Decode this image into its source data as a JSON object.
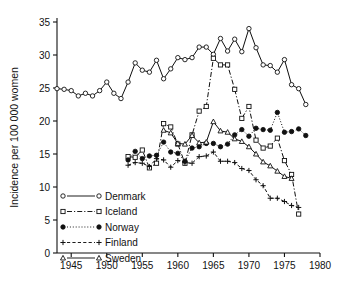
{
  "chart_data": {
    "type": "line",
    "title": "",
    "subtitle": "",
    "xlabel": "",
    "ylabel": "Incidence per 100 000 women",
    "xlim": [
      1943,
      1980
    ],
    "ylim": [
      0,
      35
    ],
    "xticks": [
      1945,
      1950,
      1955,
      1960,
      1965,
      1970,
      1975,
      1980
    ],
    "yticks": [
      0,
      5,
      10,
      15,
      20,
      25,
      30,
      35
    ],
    "xtick_labels": [
      "1945",
      "1950",
      "1955",
      "1960",
      "1965",
      "1970",
      "1975",
      "1980"
    ],
    "ytick_labels": [
      "0",
      "5",
      "10",
      "15",
      "20",
      "25",
      "30",
      "35"
    ],
    "grid": false,
    "legend_position": "lower-left-inside",
    "series": [
      {
        "name": "Denmark",
        "marker": "open-circle",
        "line_style": "solid",
        "color": "#000000",
        "x": [
          1943,
          1944,
          1945,
          1946,
          1947,
          1948,
          1949,
          1950,
          1951,
          1952,
          1953,
          1954,
          1955,
          1956,
          1957,
          1958,
          1959,
          1960,
          1961,
          1962,
          1963,
          1964,
          1965,
          1966,
          1967,
          1968,
          1969,
          1970,
          1971,
          1972,
          1973,
          1974,
          1975,
          1976,
          1977,
          1978
        ],
        "y": [
          24.9,
          24.8,
          24.6,
          23.8,
          24.2,
          23.8,
          24.6,
          25.9,
          24.2,
          23.4,
          25.9,
          28.8,
          27.7,
          27.4,
          29.2,
          26.4,
          27.9,
          29.6,
          29.3,
          29.6,
          31.2,
          31.2,
          30.1,
          32.5,
          30.6,
          32.4,
          30.5,
          34.0,
          31.1,
          28.5,
          28.4,
          27.4,
          29.3,
          25.5,
          24.9,
          22.5
        ]
      },
      {
        "name": "Iceland",
        "marker": "open-square",
        "line_style": "dash-dot",
        "color": "#000000",
        "x": [
          1953,
          1954,
          1955,
          1956,
          1957,
          1958,
          1959,
          1960,
          1961,
          1962,
          1963,
          1964,
          1965,
          1966,
          1967,
          1968,
          1969,
          1970,
          1971,
          1972,
          1973,
          1974,
          1975,
          1976,
          1977
        ],
        "y": [
          14.6,
          14.5,
          15.6,
          12.9,
          13.6,
          19.6,
          19.1,
          16.5,
          13.6,
          17.9,
          21.5,
          22.2,
          29.5,
          28.5,
          28.5,
          24.8,
          20.4,
          22.2,
          17.1,
          15.9,
          16.2,
          17.4,
          14.0,
          11.9,
          5.9
        ]
      },
      {
        "name": "Norway",
        "marker": "filled-circle",
        "line_style": "dotted",
        "color": "#000000",
        "x": [
          1953,
          1954,
          1955,
          1956,
          1957,
          1958,
          1959,
          1960,
          1961,
          1962,
          1963,
          1964,
          1965,
          1966,
          1967,
          1968,
          1969,
          1970,
          1971,
          1972,
          1973,
          1974,
          1975,
          1976,
          1977,
          1978
        ],
        "y": [
          14.1,
          15.4,
          14.3,
          14.7,
          14.8,
          16.8,
          15.3,
          15.1,
          13.9,
          15.9,
          16.1,
          16.6,
          16.6,
          16.1,
          16.5,
          17.9,
          18.7,
          17.7,
          18.9,
          18.7,
          18.6,
          21.3,
          18.3,
          18.4,
          18.8,
          17.8
        ]
      },
      {
        "name": "Finland",
        "marker": "plus",
        "line_style": "dashed",
        "color": "#000000",
        "x": [
          1953,
          1954,
          1955,
          1956,
          1957,
          1958,
          1959,
          1960,
          1961,
          1962,
          1963,
          1964,
          1965,
          1966,
          1967,
          1968,
          1969,
          1970,
          1971,
          1972,
          1973,
          1974,
          1975,
          1976,
          1977
        ],
        "y": [
          13.3,
          13.7,
          13.6,
          13.1,
          14.3,
          14.1,
          13.0,
          14.0,
          13.7,
          13.6,
          14.6,
          14.7,
          15.3,
          13.9,
          13.9,
          13.7,
          12.8,
          12.5,
          11.1,
          10.2,
          8.3,
          8.3,
          7.8,
          7.2,
          6.9
        ]
      },
      {
        "name": "Sweden",
        "marker": "open-triangle",
        "line_style": "solid",
        "color": "#000000",
        "x": [
          1958,
          1959,
          1960,
          1961,
          1962,
          1963,
          1964,
          1965,
          1966,
          1967,
          1968,
          1969,
          1970,
          1971,
          1972,
          1973,
          1974,
          1975,
          1976
        ],
        "y": [
          18.6,
          18.2,
          16.6,
          16.5,
          17.8,
          16.7,
          16.8,
          19.9,
          18.5,
          18.3,
          17.3,
          16.9,
          16.1,
          15.0,
          13.8,
          13.2,
          12.4,
          11.6,
          11.3
        ]
      }
    ]
  },
  "legend": {
    "entries": [
      {
        "label": "Denmark",
        "marker": "open-circle",
        "line_style": "solid"
      },
      {
        "label": "Iceland",
        "marker": "open-square",
        "line_style": "dash-dot"
      },
      {
        "label": "Norway",
        "marker": "filled-circle",
        "line_style": "dotted"
      },
      {
        "label": "Finland",
        "marker": "plus",
        "line_style": "dashed"
      },
      {
        "label": "Sweden",
        "marker": "open-triangle",
        "line_style": "solid"
      }
    ]
  }
}
